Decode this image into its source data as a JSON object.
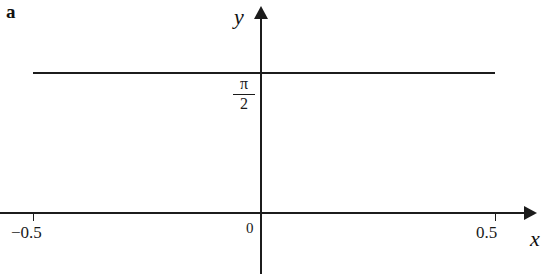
{
  "figure": {
    "panel_letter": "a",
    "background_color": "#ffffff",
    "ink_color": "#1c1c1c"
  },
  "axes": {
    "x_name": "x",
    "y_name": "y",
    "origin_label": "0"
  },
  "ticks": {
    "x_left_label": "−0.5",
    "x_right_label": "0.5"
  },
  "annotations": {
    "pi_numerator": "π",
    "pi_denominator": "2"
  },
  "chart_data": {
    "type": "line",
    "title": "",
    "subtitle": "",
    "xlabel": "x",
    "ylabel": "y",
    "xlim": [
      -0.62,
      0.58
    ],
    "ylim": [
      -0.18,
      2.2
    ],
    "grid": false,
    "legend": null,
    "x_ticks": [
      -0.5,
      0.5
    ],
    "x_tick_labels": [
      "−0.5",
      "0.5"
    ],
    "y_ticks": [
      1.5708
    ],
    "y_tick_labels": [
      "π/2"
    ],
    "annotations": [
      "a"
    ],
    "series": [
      {
        "name": "y = π/2",
        "type": "line",
        "color": "#1c1c1c",
        "x": [
          -0.5,
          0.5
        ],
        "values": [
          1.5708,
          1.5708
        ]
      }
    ]
  }
}
